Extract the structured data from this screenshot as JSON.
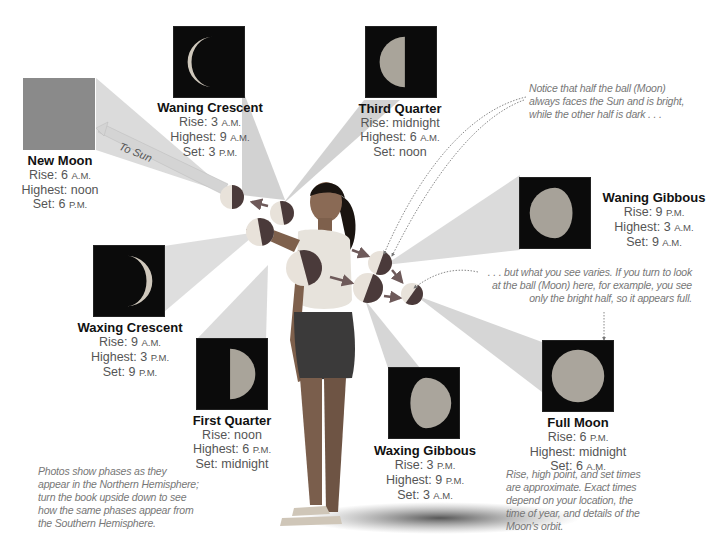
{
  "diagram": {
    "to_sun_label": "To Sun",
    "phases": [
      {
        "id": "new-moon",
        "name": "New Moon",
        "rise": "6",
        "rise_suffix": "A.M.",
        "highest": "noon",
        "highest_suffix": "",
        "set": "6",
        "set_suffix": "P.M.",
        "rise_label": "Rise:",
        "highest_label": "Highest:",
        "set_label": "Set:"
      },
      {
        "id": "waning-crescent",
        "name": "Waning Crescent",
        "rise": "3",
        "rise_suffix": "A.M.",
        "highest": "9",
        "highest_suffix": "A.M.",
        "set": "3",
        "set_suffix": "P.M.",
        "rise_label": "Rise:",
        "highest_label": "Highest:",
        "set_label": "Set:"
      },
      {
        "id": "third-quarter",
        "name": "Third Quarter",
        "rise": "midnight",
        "rise_suffix": "",
        "highest": "6",
        "highest_suffix": "A.M.",
        "set": "noon",
        "set_suffix": "",
        "rise_label": "Rise:",
        "highest_label": "Highest:",
        "set_label": "Set:"
      },
      {
        "id": "waning-gibbous",
        "name": "Waning Gibbous",
        "rise": "9",
        "rise_suffix": "P.M.",
        "highest": "3",
        "highest_suffix": "A.M.",
        "set": "9",
        "set_suffix": "A.M.",
        "rise_label": "Rise:",
        "highest_label": "Highest:",
        "set_label": "Set:"
      },
      {
        "id": "waxing-crescent",
        "name": "Waxing Crescent",
        "rise": "9",
        "rise_suffix": "A.M.",
        "highest": "3",
        "highest_suffix": "P.M.",
        "set": "9",
        "set_suffix": "P.M.",
        "rise_label": "Rise:",
        "highest_label": "Highest:",
        "set_label": "Set:"
      },
      {
        "id": "first-quarter",
        "name": "First Quarter",
        "rise": "noon",
        "rise_suffix": "",
        "highest": "6",
        "highest_suffix": "P.M.",
        "set": "midnight",
        "set_suffix": "",
        "rise_label": "Rise:",
        "highest_label": "Highest:",
        "set_label": "Set:"
      },
      {
        "id": "waxing-gibbous",
        "name": "Waxing Gibbous",
        "rise": "3",
        "rise_suffix": "P.M.",
        "highest": "9",
        "highest_suffix": "P.M.",
        "set": "3",
        "set_suffix": "A.M.",
        "rise_label": "Rise:",
        "highest_label": "Highest:",
        "set_label": "Set:"
      },
      {
        "id": "full-moon",
        "name": "Full Moon",
        "rise": "6",
        "rise_suffix": "P.M.",
        "highest": "midnight",
        "highest_suffix": "",
        "set": "6",
        "set_suffix": "A.M.",
        "rise_label": "Rise:",
        "highest_label": "Highest:",
        "set_label": "Set:"
      }
    ],
    "notes": {
      "half_bright": "Notice that half the ball (Moon) always faces the Sun and is bright, while the other half is dark . . .",
      "what_you_see": ". . . but what you see varies. If you turn to look at the ball (Moon) here, for example, you see only the bright half, so it appears full.",
      "hemisphere": "Photos show phases as they appear in the Northern Hemisphere; turn the book upside down to see how the same phases appear from the Southern Hemisphere.",
      "approximate": "Rise, high point, and set times are approximate. Exact times depend on your location, the time of year, and details of the Moon's orbit."
    },
    "colors": {
      "background": "#ffffff",
      "photo_bg": "#0b0b0b",
      "new_moon_square": "#8a8a8a",
      "beam": "#c9c9c9",
      "ball_light": "#e8e2da",
      "ball_dark": "#4a3a3a",
      "arrow": "#6e5a5a",
      "label_text": "#555555",
      "note_text": "#777777"
    }
  }
}
